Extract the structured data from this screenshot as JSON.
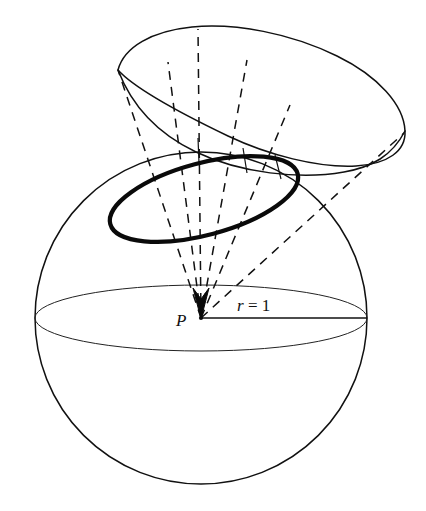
{
  "figure": {
    "background_color": "#ffffff",
    "stroke_color": "#111111",
    "width": 426,
    "height": 511
  },
  "labels": {
    "center_point": "P",
    "radius_label": "r = 1",
    "radius_symbol": "r",
    "radius_equals": " = ",
    "radius_value": "1"
  },
  "geometry": {
    "sphere": {
      "name": "unit-sphere",
      "center_x": 201,
      "center_y": 318,
      "radius": 166,
      "stroke_width": 1.4
    },
    "equator": {
      "name": "equator-ellipse",
      "center_x": 201,
      "center_y": 318,
      "rx": 166,
      "ry": 33,
      "stroke_width": 1.1
    },
    "radius_line": {
      "name": "radius-segment",
      "x1": 201,
      "y1": 318,
      "x2": 367,
      "y2": 318,
      "stroke_width": 1.6
    },
    "apex": {
      "name": "cone-apex",
      "x": 201,
      "y": 318
    },
    "spherical_cap": {
      "name": "bold-cap-ellipse",
      "stroke_width": 4.0,
      "description": "thick closed curve where the cone meets the sphere"
    },
    "far_patch": {
      "name": "far-surface-patch",
      "stroke_width": 1.5,
      "description": "irregular closed curve above the sphere subtending the same solid angle"
    },
    "rays": {
      "name": "dashed-generator-rays",
      "count": 5,
      "dash_pattern": "9 7",
      "stroke_width": 1.4
    },
    "arrow": {
      "name": "apex-arrowhead",
      "description": "solid arrowhead pointing down into P"
    }
  }
}
